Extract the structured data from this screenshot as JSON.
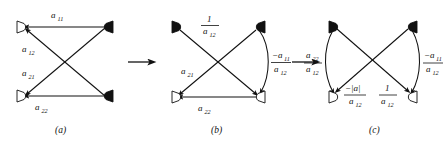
{
  "figure": {
    "background_color": "#ffffff",
    "ink_color": "#111111"
  },
  "panels": [
    {
      "id": "a",
      "caption": "(a)",
      "nodes": [
        {
          "name": "top-left",
          "style": "open"
        },
        {
          "name": "bottom-left",
          "style": "open"
        },
        {
          "name": "top-right",
          "style": "filled"
        },
        {
          "name": "bottom-right",
          "style": "filled"
        }
      ],
      "edges": [
        {
          "name": "top-horizontal",
          "from": "top-right",
          "to": "top-left",
          "shape": "straight",
          "label": {
            "kind": "plain",
            "base": "a",
            "sub": "11"
          }
        },
        {
          "name": "upper-diagonal",
          "from": "bottom-right",
          "to": "top-left",
          "shape": "straight",
          "label": {
            "kind": "plain",
            "base": "a",
            "sub": "12"
          }
        },
        {
          "name": "lower-diagonal",
          "from": "top-right",
          "to": "bottom-left",
          "shape": "straight",
          "label": {
            "kind": "plain",
            "base": "a",
            "sub": "21"
          }
        },
        {
          "name": "bottom-horizontal",
          "from": "bottom-right",
          "to": "bottom-left",
          "shape": "straight",
          "label": {
            "kind": "plain",
            "base": "a",
            "sub": "22"
          }
        }
      ]
    },
    {
      "id": "b",
      "caption": "(b)",
      "nodes": [
        {
          "name": "top-left",
          "style": "filled"
        },
        {
          "name": "top-right",
          "style": "filled"
        },
        {
          "name": "bottom-left",
          "style": "open"
        },
        {
          "name": "bottom-right",
          "style": "open"
        }
      ],
      "edges": [
        {
          "name": "upper-left-diagonal",
          "from": "top-left",
          "to": "bottom-right",
          "shape": "straight",
          "label": {
            "kind": "fraction",
            "numerator": "1",
            "num_sub": "",
            "denominator": "a",
            "den_sub": "12"
          }
        },
        {
          "name": "lower-left-diagonal",
          "from": "top-right",
          "to": "bottom-left",
          "shape": "straight",
          "label": {
            "kind": "plain",
            "base": "a",
            "sub": "21"
          }
        },
        {
          "name": "right-curve",
          "from": "top-right",
          "to": "bottom-right",
          "shape": "curved",
          "label": {
            "kind": "fraction",
            "numerator": "−a",
            "num_sub": "11",
            "denominator": "a",
            "den_sub": "12"
          }
        },
        {
          "name": "bottom-horizontal",
          "from": "bottom-right",
          "to": "bottom-left",
          "shape": "straight",
          "label": {
            "kind": "plain",
            "base": "a",
            "sub": "22"
          }
        }
      ]
    },
    {
      "id": "c",
      "caption": "(c)",
      "nodes": [
        {
          "name": "top-left",
          "style": "filled"
        },
        {
          "name": "top-right",
          "style": "filled"
        },
        {
          "name": "bottom-left",
          "style": "open"
        },
        {
          "name": "bottom-right",
          "style": "open"
        }
      ],
      "edges": [
        {
          "name": "left-curve",
          "from": "top-left",
          "to": "bottom-left",
          "shape": "curved",
          "label": {
            "kind": "fraction",
            "numerator": "a",
            "num_sub": "22",
            "denominator": "a",
            "den_sub": "12"
          }
        },
        {
          "name": "right-curve",
          "from": "top-right",
          "to": "bottom-right",
          "shape": "curved",
          "label": {
            "kind": "fraction",
            "numerator": "−a",
            "num_sub": "11",
            "denominator": "a",
            "den_sub": "12"
          }
        },
        {
          "name": "upper-right-diagonal",
          "from": "top-left",
          "to": "bottom-right",
          "shape": "straight",
          "label": {
            "kind": "fraction",
            "numerator": "1",
            "num_sub": "",
            "denominator": "a",
            "den_sub": "12"
          }
        },
        {
          "name": "upper-left-diagonal",
          "from": "top-right",
          "to": "bottom-left",
          "shape": "straight",
          "label": {
            "kind": "fraction",
            "numerator": "−|a|",
            "num_sub": "",
            "denominator": "a",
            "den_sub": "12"
          }
        }
      ]
    }
  ],
  "transform_arrows": [
    {
      "name": "arrow-a-to-b",
      "direction": "right"
    },
    {
      "name": "arrow-b-to-c",
      "direction": "right"
    }
  ],
  "labels": {
    "a11": "a",
    "a11_sub": "11",
    "a12": "a",
    "a12_sub": "12",
    "a21": "a",
    "a21_sub": "21",
    "a22": "a",
    "a22_sub": "22",
    "one": "1",
    "neg_a11": "−a",
    "neg_det": "−|a|",
    "caption_a": "(a)",
    "caption_b": "(b)",
    "caption_c": "(c)"
  }
}
